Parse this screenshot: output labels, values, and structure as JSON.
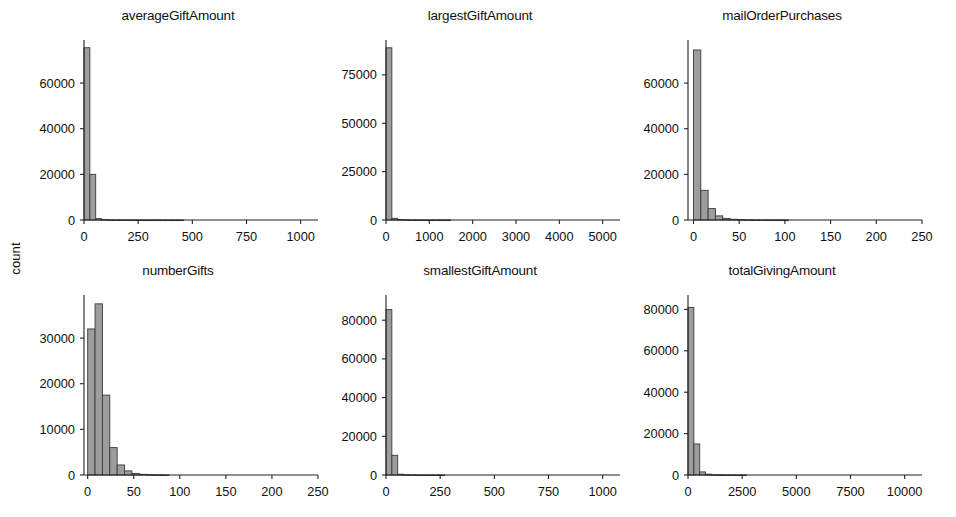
{
  "figure": {
    "ylabel": "count",
    "bar_fill": "#9d9d9d",
    "bar_edge": "#3b3b3b",
    "axis_color": "#222222",
    "background": "#ffffff",
    "grid": false,
    "legend": false,
    "layout": "2 rows x 3 columns of histogram panels sharing the y-axis label 'count'"
  },
  "chart_data": [
    {
      "type": "bar",
      "title": "averageGiftAmount",
      "xlabel": "",
      "ylabel": "count",
      "xlim": [
        0,
        1080
      ],
      "ylim": [
        0,
        78000
      ],
      "xticks": [
        0,
        250,
        500,
        750,
        1000
      ],
      "xticklabels": [
        "0",
        "250",
        "500",
        "750",
        "1000"
      ],
      "yticks": [
        0,
        20000,
        40000,
        60000
      ],
      "yticklabels": [
        "0",
        "20000",
        "40000",
        "60000"
      ],
      "bin_width": 27,
      "bin_starts": [
        0,
        27,
        54,
        81,
        108,
        135,
        162,
        189,
        216,
        243,
        270,
        297,
        324,
        351,
        378,
        405,
        432
      ],
      "values": [
        75500,
        20000,
        600,
        180,
        90,
        50,
        30,
        20,
        12,
        10,
        8,
        5,
        4,
        3,
        2,
        2,
        1
      ],
      "categories": [
        "0-27",
        "27-54",
        "54-81",
        "81-108",
        "108-135",
        "135-162",
        "162-189",
        "189-216",
        "216-243",
        "243-270",
        "270-297",
        "297-324",
        "324-351",
        "351-378",
        "378-405",
        "405-432",
        "432-459"
      ]
    },
    {
      "type": "bar",
      "title": "largestGiftAmount",
      "xlabel": "",
      "ylabel": "count",
      "xlim": [
        0,
        5400
      ],
      "ylim": [
        0,
        92000
      ],
      "xticks": [
        0,
        1000,
        2000,
        3000,
        4000,
        5000
      ],
      "xticklabels": [
        "0",
        "1000",
        "2000",
        "3000",
        "4000",
        "5000"
      ],
      "yticks": [
        0,
        25000,
        50000,
        75000
      ],
      "yticklabels": [
        "0",
        "25000",
        "50000",
        "75000"
      ],
      "bin_width": 135,
      "bin_starts": [
        0,
        135,
        270,
        405,
        540,
        675,
        810,
        945,
        1080,
        1215,
        1350
      ],
      "values": [
        89000,
        900,
        250,
        120,
        70,
        40,
        25,
        15,
        10,
        8,
        5
      ],
      "categories": [
        "0-135",
        "135-270",
        "270-405",
        "405-540",
        "540-675",
        "675-810",
        "810-945",
        "945-1080",
        "1080-1215",
        "1215-1350",
        "1350-1485"
      ]
    },
    {
      "type": "bar",
      "title": "mailOrderPurchases",
      "xlabel": "",
      "ylabel": "count",
      "xlim": [
        -6,
        250
      ],
      "ylim": [
        0,
        78000
      ],
      "xticks": [
        0,
        50,
        100,
        150,
        200,
        250
      ],
      "xticklabels": [
        "0",
        "50",
        "100",
        "150",
        "200",
        "250"
      ],
      "yticks": [
        0,
        20000,
        40000,
        60000
      ],
      "yticklabels": [
        "0",
        "20000",
        "40000",
        "60000"
      ],
      "bin_width": 8,
      "bin_starts": [
        0,
        8,
        16,
        24,
        32,
        40,
        48,
        56,
        64,
        72,
        80,
        88,
        96
      ],
      "values": [
        74500,
        13000,
        5000,
        1800,
        700,
        320,
        160,
        90,
        50,
        30,
        18,
        10,
        6
      ],
      "categories": [
        "0-8",
        "8-16",
        "16-24",
        "24-32",
        "32-40",
        "40-48",
        "48-56",
        "56-64",
        "64-72",
        "72-80",
        "80-88",
        "88-96",
        "96-104"
      ]
    },
    {
      "type": "bar",
      "title": "numberGifts",
      "xlabel": "",
      "ylabel": "count",
      "xlim": [
        -4,
        250
      ],
      "ylim": [
        0,
        39000
      ],
      "xticks": [
        0,
        50,
        100,
        150,
        200,
        250
      ],
      "xticklabels": [
        "0",
        "50",
        "100",
        "150",
        "200",
        "250"
      ],
      "yticks": [
        0,
        10000,
        20000,
        30000
      ],
      "yticklabels": [
        "0",
        "10000",
        "20000",
        "30000"
      ],
      "bin_width": 8,
      "bin_starts": [
        0,
        8,
        16,
        24,
        32,
        40,
        48,
        56,
        64,
        72,
        80
      ],
      "values": [
        32000,
        37500,
        17500,
        6000,
        2200,
        900,
        350,
        150,
        80,
        40,
        20
      ],
      "categories": [
        "0-8",
        "8-16",
        "16-24",
        "24-32",
        "32-40",
        "40-48",
        "48-56",
        "56-64",
        "64-72",
        "72-80",
        "80-88"
      ]
    },
    {
      "type": "bar",
      "title": "smallestGiftAmount",
      "xlabel": "",
      "ylabel": "count",
      "xlim": [
        0,
        1080
      ],
      "ylim": [
        0,
        92000
      ],
      "xticks": [
        0,
        250,
        500,
        750,
        1000
      ],
      "xticklabels": [
        "0",
        "250",
        "500",
        "750",
        "1000"
      ],
      "yticks": [
        0,
        20000,
        40000,
        60000,
        80000
      ],
      "yticklabels": [
        "0",
        "20000",
        "40000",
        "60000",
        "80000"
      ],
      "bin_width": 27,
      "bin_starts": [
        0,
        27,
        54,
        81,
        108,
        135,
        162,
        189,
        216,
        243
      ],
      "values": [
        85500,
        10200,
        400,
        120,
        60,
        35,
        20,
        12,
        8,
        5
      ],
      "categories": [
        "0-27",
        "27-54",
        "54-81",
        "81-108",
        "108-135",
        "135-162",
        "162-189",
        "189-216",
        "216-243",
        "243-270"
      ]
    },
    {
      "type": "bar",
      "title": "totalGivingAmount",
      "xlabel": "",
      "ylabel": "count",
      "xlim": [
        0,
        10800
      ],
      "ylim": [
        0,
        86000
      ],
      "xticks": [
        0,
        2500,
        5000,
        7500,
        10000
      ],
      "xticklabels": [
        "0",
        "2500",
        "5000",
        "7500",
        "10000"
      ],
      "yticks": [
        0,
        20000,
        40000,
        60000,
        80000
      ],
      "yticklabels": [
        "0",
        "20000",
        "40000",
        "60000",
        "80000"
      ],
      "bin_width": 270,
      "bin_starts": [
        0,
        270,
        540,
        810,
        1080,
        1350,
        1620,
        1890,
        2160,
        2430
      ],
      "values": [
        81000,
        15000,
        1500,
        400,
        150,
        80,
        45,
        25,
        15,
        10
      ],
      "categories": [
        "0-270",
        "270-540",
        "540-810",
        "810-1080",
        "1080-1350",
        "1350-1620",
        "1620-1890",
        "1890-2160",
        "2160-2430",
        "2430-2700"
      ]
    }
  ]
}
